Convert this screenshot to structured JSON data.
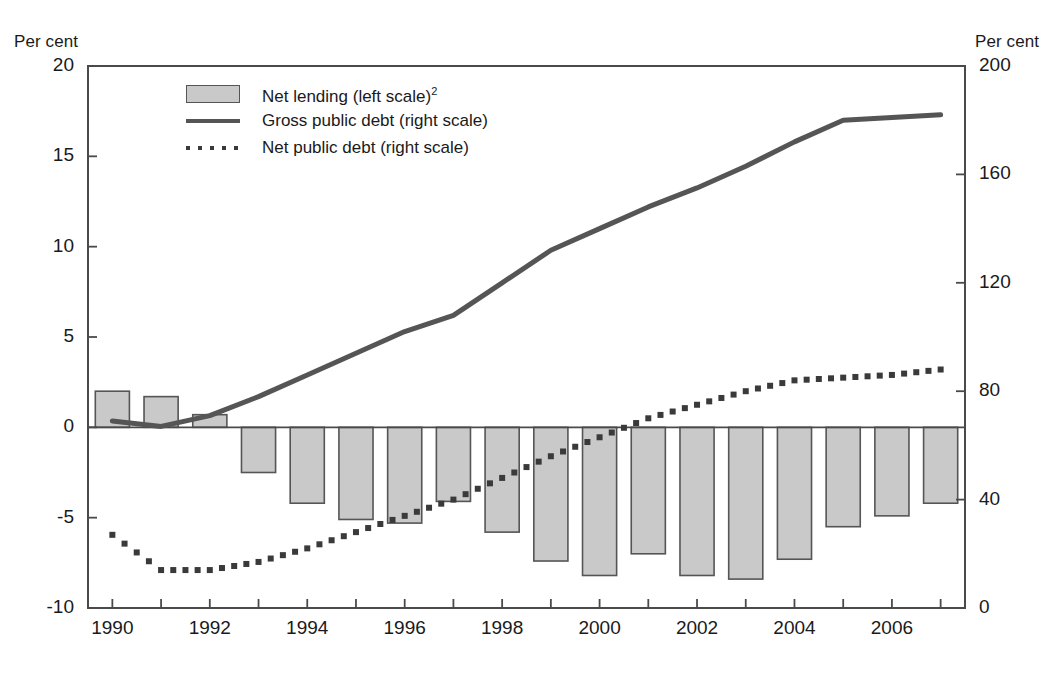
{
  "axes": {
    "left_unit": "Per cent",
    "right_unit": "Per cent",
    "left_ticks": [
      "20",
      "15",
      "10",
      "5",
      "0",
      "-5",
      "-10"
    ],
    "right_ticks": [
      "200",
      "160",
      "120",
      "80",
      "40",
      "0"
    ],
    "x_ticks": [
      "1990",
      "1992",
      "1994",
      "1996",
      "1998",
      "2000",
      "2002",
      "2004",
      "2006"
    ]
  },
  "legend": {
    "items": [
      {
        "key": "bar-swatch",
        "label": "Net lending (left scale)",
        "footnote": "2"
      },
      {
        "key": "solid-line",
        "label": "Gross public debt (right scale)",
        "footnote": ""
      },
      {
        "key": "dotted-line",
        "label": "Net public debt (right scale)",
        "footnote": ""
      }
    ]
  },
  "colors": {
    "bar_fill": "#c9c9c9",
    "bar_border": "#555555",
    "line_solid": "#555555",
    "line_dotted": "#3a3a3a",
    "axis": "#4a4a4a",
    "background": "#ffffff"
  },
  "chart_data": {
    "type": "bar",
    "title": "",
    "subtitle": "",
    "xlabel": "",
    "ylabel": "Per cent",
    "y2label": "Per cent",
    "ylim": [
      -10,
      20
    ],
    "y2lim": [
      0,
      200
    ],
    "xlim": [
      1989.5,
      2007.5
    ],
    "grid": false,
    "legend_position": "top-left inside",
    "categories": [
      1990,
      1991,
      1992,
      1993,
      1994,
      1995,
      1996,
      1997,
      1998,
      1999,
      2000,
      2001,
      2002,
      2003,
      2004,
      2005,
      2006,
      2007
    ],
    "series": [
      {
        "name": "Net lending (left scale)",
        "type": "bar",
        "axis": "left",
        "values": [
          2.0,
          1.7,
          0.7,
          -2.5,
          -4.2,
          -5.1,
          -5.3,
          -4.1,
          -5.8,
          -7.4,
          -8.2,
          -7.0,
          -8.2,
          -8.4,
          -7.3,
          -5.5,
          -4.9,
          -4.2
        ]
      },
      {
        "name": "Gross public debt (right scale)",
        "type": "line",
        "axis": "right",
        "values": [
          69,
          67,
          71,
          78,
          86,
          94,
          102,
          108,
          120,
          132,
          140,
          148,
          155,
          163,
          172,
          180,
          181,
          182
        ]
      },
      {
        "name": "Net public debt (right scale)",
        "type": "line-dotted",
        "axis": "right",
        "values": [
          27,
          14,
          14,
          17,
          22,
          28,
          34,
          40,
          48,
          56,
          63,
          70,
          75,
          80,
          84,
          85,
          86,
          88
        ]
      }
    ]
  }
}
